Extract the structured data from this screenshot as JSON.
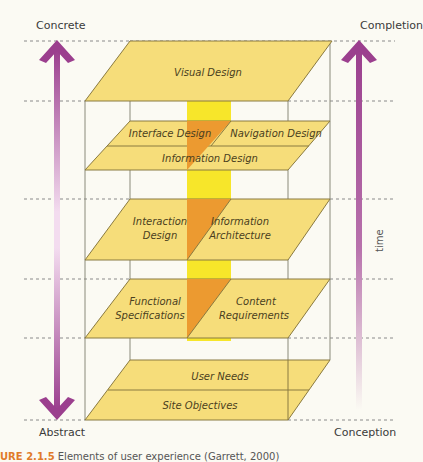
{
  "axis_labels": {
    "top_left": "Concrete",
    "bottom_left": "Abstract",
    "top_right": "Completion",
    "bottom_right": "Conception",
    "time": "time"
  },
  "planes": {
    "surface": {
      "label": "Visual Design"
    },
    "skeleton": {
      "left": "Interface Design",
      "right": "Navigation Design",
      "bottom": "Information Design"
    },
    "structure": {
      "left_line1": "Interaction",
      "left_line2": "Design",
      "right_line1": "Information",
      "right_line2": "Architecture"
    },
    "scope": {
      "left_line1": "Functional",
      "left_line2": "Specifications",
      "right_line1": "Content",
      "right_line2": "Requirements"
    },
    "strategy": {
      "top": "User Needs",
      "bottom": "Site Objectives"
    }
  },
  "caption": {
    "figure": "URE 2.1.5",
    "text": "Elements of user experience (Garrett, 2000)"
  },
  "colors": {
    "plane_fill": "#f6dd7a",
    "plane_stroke": "#8a7a40",
    "column_yellow": "#f7e62a",
    "column_orange": "#ec9a30",
    "arrow_purple": "#9b3f8e"
  }
}
